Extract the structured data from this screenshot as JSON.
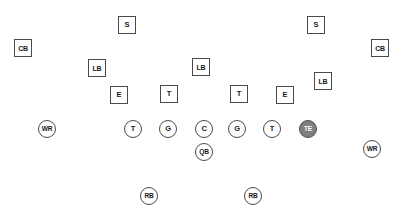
{
  "diagram": {
    "width": 405,
    "height": 222,
    "background_color": "#ffffff",
    "outline_color": "#4a4a4a",
    "text_color": "#1a1a1a",
    "highlight_fill_color": "#7f7f7f",
    "highlight_text_color": "#ffffff"
  },
  "players": [
    {
      "label": "S",
      "shape": "square",
      "unit": "defense",
      "name": "safety-left",
      "x": 127,
      "y": 25,
      "highlighted": false
    },
    {
      "label": "S",
      "shape": "square",
      "unit": "defense",
      "name": "safety-right",
      "x": 316,
      "y": 25,
      "highlighted": false
    },
    {
      "label": "CB",
      "shape": "square",
      "unit": "defense",
      "name": "cornerback-left",
      "x": 23,
      "y": 48,
      "highlighted": false
    },
    {
      "label": "CB",
      "shape": "square",
      "unit": "defense",
      "name": "cornerback-right",
      "x": 380,
      "y": 48,
      "highlighted": false
    },
    {
      "label": "LB",
      "shape": "square",
      "unit": "defense",
      "name": "linebacker-left",
      "x": 97,
      "y": 68,
      "highlighted": false
    },
    {
      "label": "LB",
      "shape": "square",
      "unit": "defense",
      "name": "linebacker-middle",
      "x": 201,
      "y": 67,
      "highlighted": false
    },
    {
      "label": "LB",
      "shape": "square",
      "unit": "defense",
      "name": "linebacker-right",
      "x": 323,
      "y": 81,
      "highlighted": false
    },
    {
      "label": "E",
      "shape": "square",
      "unit": "defense",
      "name": "defensive-end-left",
      "x": 119,
      "y": 95,
      "highlighted": false
    },
    {
      "label": "T",
      "shape": "square",
      "unit": "defense",
      "name": "defensive-tackle-left",
      "x": 169,
      "y": 94,
      "highlighted": false
    },
    {
      "label": "T",
      "shape": "square",
      "unit": "defense",
      "name": "defensive-tackle-right",
      "x": 239,
      "y": 94,
      "highlighted": false
    },
    {
      "label": "E",
      "shape": "square",
      "unit": "defense",
      "name": "defensive-end-right",
      "x": 285,
      "y": 95,
      "highlighted": false
    },
    {
      "label": "WR",
      "shape": "circle",
      "unit": "offense",
      "name": "wide-receiver-left",
      "x": 47,
      "y": 129,
      "highlighted": false
    },
    {
      "label": "T",
      "shape": "circle",
      "unit": "offense",
      "name": "offensive-tackle-left",
      "x": 133,
      "y": 129,
      "highlighted": false
    },
    {
      "label": "G",
      "shape": "circle",
      "unit": "offense",
      "name": "offensive-guard-left",
      "x": 168,
      "y": 129,
      "highlighted": false
    },
    {
      "label": "C",
      "shape": "circle",
      "unit": "offense",
      "name": "center",
      "x": 204,
      "y": 129,
      "highlighted": false
    },
    {
      "label": "G",
      "shape": "circle",
      "unit": "offense",
      "name": "offensive-guard-right",
      "x": 237,
      "y": 129,
      "highlighted": false
    },
    {
      "label": "T",
      "shape": "circle",
      "unit": "offense",
      "name": "offensive-tackle-right",
      "x": 272,
      "y": 129,
      "highlighted": false
    },
    {
      "label": "TE",
      "shape": "circle",
      "unit": "offense",
      "name": "tight-end",
      "x": 308,
      "y": 129,
      "highlighted": true
    },
    {
      "label": "QB",
      "shape": "circle",
      "unit": "offense",
      "name": "quarterback",
      "x": 204,
      "y": 152,
      "highlighted": false
    },
    {
      "label": "WR",
      "shape": "circle",
      "unit": "offense",
      "name": "wide-receiver-right",
      "x": 372,
      "y": 149,
      "highlighted": false
    },
    {
      "label": "RB",
      "shape": "circle",
      "unit": "offense",
      "name": "running-back-left",
      "x": 149,
      "y": 196,
      "highlighted": false
    },
    {
      "label": "RB",
      "shape": "circle",
      "unit": "offense",
      "name": "running-back-right",
      "x": 253,
      "y": 196,
      "highlighted": false
    }
  ]
}
